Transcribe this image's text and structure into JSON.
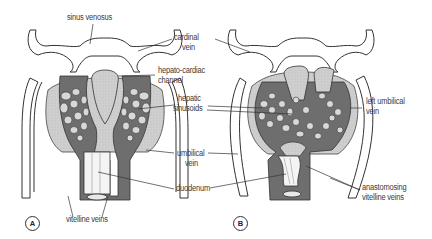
{
  "figure": {
    "colors": {
      "vessel_dark": "#6e6e6e",
      "liver_tissue": "#c9c9c9",
      "outline": "#333333",
      "background": "#ffffff",
      "label_text": "#3a3a3a"
    },
    "panels": [
      {
        "id": "A",
        "badge": "A"
      },
      {
        "id": "B",
        "badge": "B"
      }
    ],
    "labels": {
      "sinus_venosus": "sinus venosus",
      "cardinal_vein_1": "cardinal",
      "cardinal_vein_2": "vein",
      "hepato_cardiac_1": "hepato-cardiac",
      "hepato_cardiac_2": "channel",
      "hepatic_sinusoids_1": "hepatic",
      "hepatic_sinusoids_2": "sinusoids",
      "umbilical_vein_1": "umbilical",
      "umbilical_vein_2": "vein",
      "duodenum": "duodenum",
      "vitelline_veins": "vitelline veins",
      "left_umbilical_1": "left umbilical",
      "left_umbilical_2": "vein",
      "anastomosing_1": "anastomosing",
      "anastomosing_2": "vitelline veins"
    }
  }
}
